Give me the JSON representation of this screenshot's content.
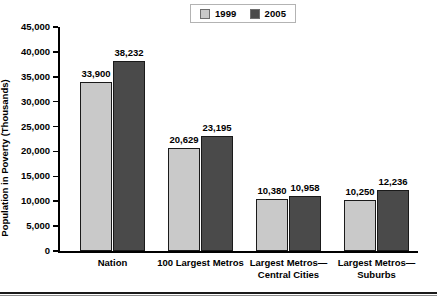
{
  "chart_data": {
    "type": "bar",
    "title": "",
    "xlabel": "",
    "ylabel": "Population in Poverty (Thousands)",
    "ylim": [
      0,
      45000
    ],
    "yticks": [
      "0",
      "5,000",
      "10,000",
      "15,000",
      "20,000",
      "25,000",
      "30,000",
      "35,000",
      "40,000",
      "45,000"
    ],
    "ytick_values": [
      0,
      5000,
      10000,
      15000,
      20000,
      25000,
      30000,
      35000,
      40000,
      45000
    ],
    "grid": false,
    "legend_position": "top-center",
    "categories": [
      {
        "line1": "Nation",
        "line2": ""
      },
      {
        "line1": "100 Largest Metros",
        "line2": ""
      },
      {
        "line1": "Largest Metros—",
        "line2": "Central Cities"
      },
      {
        "line1": "Largest Metros—",
        "line2": "Suburbs"
      }
    ],
    "series": [
      {
        "name": "1999",
        "color": "#c9c9c9",
        "values": [
          33900,
          20629,
          10380,
          10250
        ],
        "labels": [
          "33,900",
          "20,629",
          "10,380",
          "10,250"
        ]
      },
      {
        "name": "2005",
        "color": "#4a4a4a",
        "values": [
          38232,
          23195,
          10958,
          12236
        ],
        "labels": [
          "38,232",
          "23,195",
          "10,958",
          "12,236"
        ]
      }
    ]
  },
  "caption": ""
}
